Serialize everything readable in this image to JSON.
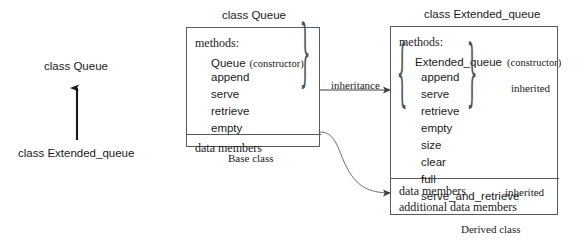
{
  "diagram": {
    "left_panel": {
      "base_label": "class Queue",
      "derived_label": "class Extended_queue",
      "arrow_direction": "up",
      "arrow_meaning": "Extended_queue inherits from Queue"
    },
    "base_box": {
      "title": "class Queue",
      "caption": "Base class",
      "methods_header": "methods:",
      "constructor": {
        "name": "Queue",
        "note": "(constructor)"
      },
      "methods": [
        "append",
        "serve",
        "retrieve",
        "empty"
      ],
      "data_section": [
        "data members"
      ],
      "brace_glyph": "}"
    },
    "derived_box": {
      "title": "class Extended_queue",
      "caption": "Derived class",
      "methods_header": "methods:",
      "constructor": {
        "name": "Extended_queue",
        "note": "(constructor)"
      },
      "inherited_methods": [
        "append",
        "serve",
        "retrieve",
        "empty"
      ],
      "new_methods": [
        "size",
        "clear",
        "full",
        "serve_and_retrieve"
      ],
      "data_section": [
        "data members",
        "additional data members"
      ],
      "brace_left_glyph": "{",
      "brace_right_glyph": "}"
    },
    "connectors": {
      "inheritance_label": "inheritance",
      "inherited_methods_label": "inherited",
      "inherited_data_label": "inherited"
    },
    "colors": {
      "stroke": "#555c61",
      "text": "#1a1a1a",
      "background": "#ffffff"
    }
  }
}
